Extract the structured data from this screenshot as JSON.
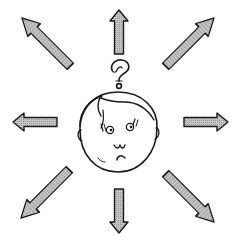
{
  "diagram": {
    "central_figure": "face",
    "symbol": "?",
    "arrow_directions": [
      "up",
      "up-right",
      "right",
      "down-right",
      "down",
      "down-left",
      "left",
      "up-left"
    ],
    "colors": {
      "outline": "#1a1a1a",
      "arrow_fill": "#b8b8b8",
      "background": "#ffffff"
    }
  }
}
